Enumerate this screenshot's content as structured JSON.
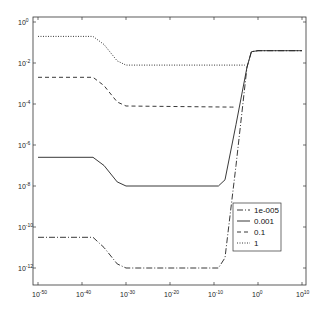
{
  "chart_data": {
    "type": "line",
    "title": "",
    "xlabel": "",
    "ylabel": "",
    "xscale": "log",
    "yscale": "log",
    "xlim_log10": [
      -51,
      11
    ],
    "ylim_log10": [
      -13,
      0.25
    ],
    "x_ticks": [
      {
        "base": "10",
        "exp": "-50",
        "log": -50
      },
      {
        "base": "10",
        "exp": "-40",
        "log": -40
      },
      {
        "base": "10",
        "exp": "-30",
        "log": -30
      },
      {
        "base": "10",
        "exp": "-20",
        "log": -20
      },
      {
        "base": "10",
        "exp": "-10",
        "log": -10
      },
      {
        "base": "10",
        "exp": "0",
        "log": 0
      },
      {
        "base": "10",
        "exp": "10",
        "log": 10
      }
    ],
    "y_ticks": [
      {
        "base": "10",
        "exp": "0",
        "log": 0
      },
      {
        "base": "10",
        "exp": "-2",
        "log": -2
      },
      {
        "base": "10",
        "exp": "-4",
        "log": -4
      },
      {
        "base": "10",
        "exp": "-6",
        "log": -6
      },
      {
        "base": "10",
        "exp": "-8",
        "log": -8
      },
      {
        "base": "10",
        "exp": "-10",
        "log": -10
      },
      {
        "base": "10",
        "exp": "-12",
        "log": -12
      }
    ],
    "grid": false,
    "legend_position": "lower right",
    "series": [
      {
        "name": "1e-005",
        "style": "dashdot",
        "points_log10": [
          [
            -50,
            -10.5
          ],
          [
            -37.5,
            -10.5
          ],
          [
            -35,
            -11.0
          ],
          [
            -32,
            -11.8
          ],
          [
            -30,
            -12.0
          ],
          [
            -9,
            -12.0
          ],
          [
            -7.5,
            -11.5
          ],
          [
            -5,
            -7.0
          ],
          [
            -2.5,
            -2.2
          ],
          [
            -1.5,
            -1.45
          ],
          [
            0,
            -1.4
          ],
          [
            10,
            -1.4
          ]
        ]
      },
      {
        "name": "0.001",
        "style": "solid",
        "points_log10": [
          [
            -50,
            -6.6
          ],
          [
            -37.5,
            -6.6
          ],
          [
            -35,
            -7.0
          ],
          [
            -32,
            -7.8
          ],
          [
            -30,
            -8.0
          ],
          [
            -9,
            -8.0
          ],
          [
            -7.5,
            -7.7
          ],
          [
            -5,
            -5.0
          ],
          [
            -2.5,
            -2.2
          ],
          [
            -1.5,
            -1.45
          ],
          [
            0,
            -1.4
          ],
          [
            10,
            -1.4
          ]
        ]
      },
      {
        "name": "0.1",
        "style": "dashed",
        "points_log10": [
          [
            -50,
            -2.7
          ],
          [
            -37.5,
            -2.7
          ],
          [
            -35,
            -3.1
          ],
          [
            -32,
            -3.9
          ],
          [
            -30,
            -4.1
          ],
          [
            -6,
            -4.15
          ],
          [
            -5,
            -4.15
          ]
        ]
      },
      {
        "name": "1",
        "style": "dotted",
        "points_log10": [
          [
            -50,
            -0.7
          ],
          [
            -37.5,
            -0.7
          ],
          [
            -35,
            -1.1
          ],
          [
            -32,
            -1.9
          ],
          [
            -30,
            -2.1
          ],
          [
            -4,
            -2.1
          ],
          [
            -3,
            -2.1
          ]
        ]
      }
    ]
  },
  "legend": {
    "items": [
      {
        "label": "1e-005",
        "dash": "6,2,1,2"
      },
      {
        "label": "0.001",
        "dash": ""
      },
      {
        "label": "0.1",
        "dash": "4,3"
      },
      {
        "label": "1",
        "dash": "1,1.5"
      }
    ]
  }
}
